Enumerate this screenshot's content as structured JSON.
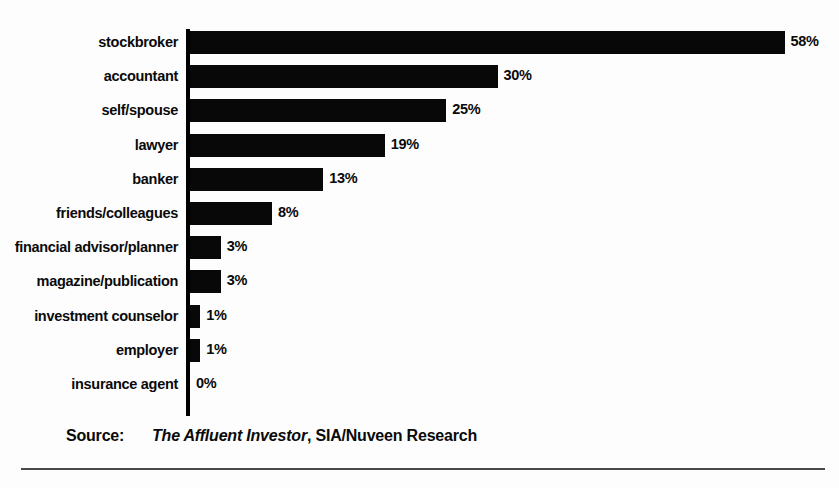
{
  "chart_data": {
    "type": "bar",
    "orientation": "horizontal",
    "title": "",
    "xlabel": "",
    "ylabel": "",
    "xlim": [
      0,
      58
    ],
    "grid": false,
    "legend": "none",
    "value_suffix": "%",
    "categories": [
      "stockbroker",
      "accountant",
      "self/spouse",
      "lawyer",
      "banker",
      "friends/colleagues",
      "financial advisor/planner",
      "magazine/publication",
      "investment counselor",
      "employer",
      "insurance agent"
    ],
    "values": [
      58,
      30,
      25,
      19,
      13,
      8,
      3,
      3,
      1,
      1,
      0
    ],
    "value_labels": [
      "58%",
      "30%",
      "25%",
      "19%",
      "13%",
      "8%",
      "3%",
      "3%",
      "1%",
      "1%",
      "0%"
    ],
    "bar_color": "#080808"
  },
  "source": {
    "label": "Source:",
    "title": "The Affluent Investor",
    "rest": ", SIA/Nuveen Research"
  }
}
